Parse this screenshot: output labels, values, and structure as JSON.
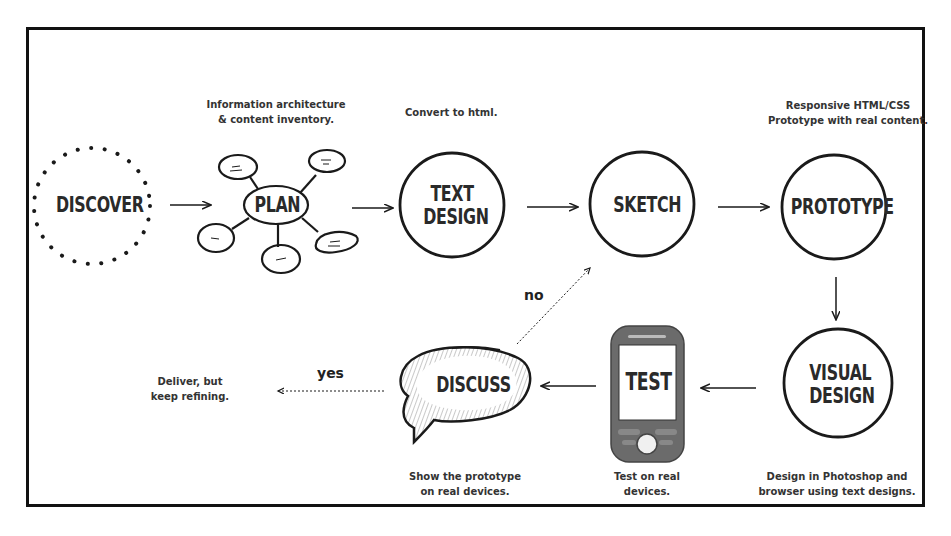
{
  "diagram": {
    "type": "process-flow",
    "nodes": [
      {
        "id": "discover",
        "label": "DISCOVER",
        "shape": "dotted-circle"
      },
      {
        "id": "plan",
        "label": "PLAN",
        "shape": "mind-map-ellipse",
        "caption": [
          "Information architecture",
          "& content inventory."
        ]
      },
      {
        "id": "text_design",
        "label_lines": [
          "TEXT",
          "DESIGN"
        ],
        "shape": "circle",
        "caption": [
          "Convert to html."
        ]
      },
      {
        "id": "sketch",
        "label": "SKETCH",
        "shape": "circle"
      },
      {
        "id": "prototype",
        "label": "PROTOTYPE",
        "shape": "circle",
        "caption": [
          "Responsive HTML/CSS",
          "Prototype with real content."
        ]
      },
      {
        "id": "visual_design",
        "label_lines": [
          "VISUAL",
          "DESIGN"
        ],
        "shape": "circle",
        "caption": [
          "Design in Photoshop and",
          "browser using text designs."
        ]
      },
      {
        "id": "test",
        "label": "TEST",
        "shape": "mobile-phone",
        "caption": [
          "Test on real",
          "devices."
        ]
      },
      {
        "id": "discuss",
        "label": "DISCUSS",
        "shape": "speech-bubble",
        "caption": [
          "Show the prototype",
          "on real devices."
        ]
      },
      {
        "id": "deliver",
        "caption": [
          "Deliver, but",
          "keep refining."
        ]
      }
    ],
    "edges": [
      {
        "from": "discover",
        "to": "plan",
        "style": "solid"
      },
      {
        "from": "plan",
        "to": "text_design",
        "style": "solid"
      },
      {
        "from": "text_design",
        "to": "sketch",
        "style": "solid"
      },
      {
        "from": "sketch",
        "to": "prototype",
        "style": "solid"
      },
      {
        "from": "prototype",
        "to": "visual_design",
        "style": "solid"
      },
      {
        "from": "visual_design",
        "to": "test",
        "style": "solid"
      },
      {
        "from": "test",
        "to": "discuss",
        "style": "solid"
      },
      {
        "from": "discuss",
        "to": "sketch",
        "style": "dotted",
        "label": "no"
      },
      {
        "from": "discuss",
        "to": "deliver",
        "style": "dotted",
        "label": "yes"
      }
    ]
  },
  "labels": {
    "discover": "DISCOVER",
    "plan": "PLAN",
    "text_design_1": "TEXT",
    "text_design_2": "DESIGN",
    "sketch": "SKETCH",
    "prototype": "PROTOTYPE",
    "visual_design_1": "VISUAL",
    "visual_design_2": "DESIGN",
    "test": "TEST",
    "discuss": "DISCUSS",
    "edge_no": "no",
    "edge_yes": "yes"
  },
  "captions": {
    "plan_1": "Information architecture",
    "plan_2": "& content inventory.",
    "text_design_1": "Convert to html.",
    "prototype_1": "Responsive HTML/CSS",
    "prototype_2": "Prototype with real content.",
    "visual_design_1": "Design in Photoshop and",
    "visual_design_2": "browser using text designs.",
    "test_1": "Test on real",
    "test_2": "devices.",
    "discuss_1": "Show the prototype",
    "discuss_2": "on real devices.",
    "deliver_1": "Deliver, but",
    "deliver_2": "keep refining."
  },
  "colors": {
    "ink": "#1a1a1a",
    "phone_body": "#6b6b6b",
    "frame": "#111111",
    "background": "#ffffff"
  }
}
